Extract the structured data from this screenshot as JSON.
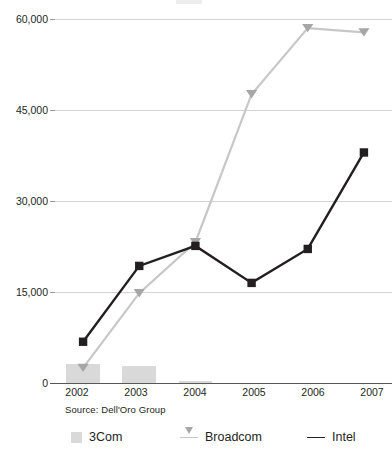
{
  "chart_data": {
    "type": "line",
    "title": "",
    "subtitle": "",
    "xlabel": "",
    "ylabel": "",
    "categories": [
      "2002",
      "2003",
      "2004",
      "2005",
      "2006",
      "2007"
    ],
    "ylim": [
      0,
      60000
    ],
    "yticks": [
      0,
      15000,
      30000,
      45000,
      60000
    ],
    "ytick_labels": [
      "0",
      "15,000",
      "30,000",
      "45,000",
      "60,000"
    ],
    "grid": true,
    "legend_position": "bottom",
    "series": [
      {
        "name": "3Com",
        "type": "bar",
        "color": "#d9d9d9",
        "marker": "square",
        "values": [
          3100,
          2800,
          350,
          0,
          0,
          0
        ]
      },
      {
        "name": "Broadcom",
        "type": "line",
        "color": "#bfbfbf",
        "marker_color": "#a6a6a6",
        "marker": "triangle-down",
        "values": [
          2500,
          14800,
          23200,
          47600,
          58500,
          57800
        ]
      },
      {
        "name": "Intel",
        "type": "line",
        "color": "#231f20",
        "marker_color": "#231f20",
        "marker": "square",
        "values": [
          6800,
          19300,
          22600,
          16500,
          22100,
          38000
        ]
      }
    ],
    "annotations": [
      {
        "name": "source-note",
        "text": "Source: Dell'Oro Group"
      }
    ]
  },
  "legend": {
    "items": [
      {
        "label": "3Com",
        "marker": "bar-swatch"
      },
      {
        "label": "Broadcom",
        "marker": "triangle-line-swatch"
      },
      {
        "label": "Intel",
        "marker": "square-line-swatch"
      }
    ]
  },
  "source": {
    "text": "Source: Dell'Oro Group"
  },
  "colors": {
    "bar": "#d9d9d9",
    "broadcom_line": "#bfbfbf",
    "broadcom_marker": "#a6a6a6",
    "intel": "#231f20",
    "gridline": "#d4d4d4",
    "axis": "#58585a",
    "text": "#231f20"
  }
}
